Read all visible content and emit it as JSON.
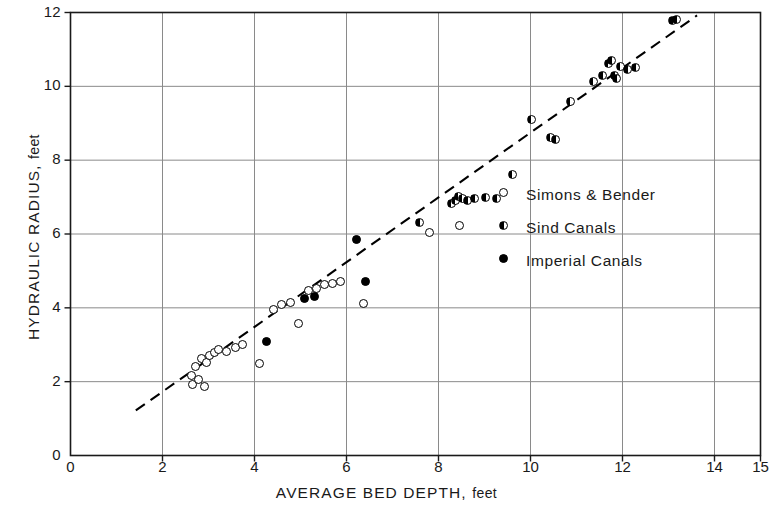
{
  "chart_data": {
    "type": "scatter",
    "title": "",
    "xlabel": "AVERAGE BED DEPTH, feet",
    "ylabel": "HYDRAULIC RADIUS, feet",
    "xlabel_main": "AVERAGE BED DEPTH,",
    "xlabel_units": "feet",
    "ylabel_main": "HYDRAULIC RADIUS,",
    "ylabel_units": "feet",
    "xlim": [
      0,
      15
    ],
    "ylim": [
      0,
      12
    ],
    "xticks": [
      0,
      2,
      4,
      6,
      8,
      10,
      12,
      14,
      15
    ],
    "yticks": [
      0,
      2,
      4,
      6,
      8,
      10,
      12
    ],
    "xtick_labels": [
      "0",
      "2",
      "4",
      "6",
      "8",
      "10",
      "12",
      "14",
      "15"
    ],
    "ytick_labels": [
      "0",
      "2",
      "4",
      "6",
      "8",
      "10",
      "12"
    ],
    "grid": true,
    "grid_x": [
      2,
      4,
      6,
      8,
      10,
      12,
      14
    ],
    "grid_y": [
      2,
      4,
      6,
      8,
      10
    ],
    "legend_position": "center-right",
    "axis_color": "#1a1a1a",
    "grid_color": "#8a8a8a",
    "marker_color": "#000000",
    "trendline": {
      "style": "dashed",
      "x0": 1.42,
      "y0": 1.22,
      "x1": 13.62,
      "y1": 11.92
    },
    "series": [
      {
        "name": "Simons & Bender",
        "marker": "open-circle",
        "points": [
          [
            2.62,
            2.18
          ],
          [
            2.66,
            1.92
          ],
          [
            2.72,
            2.4
          ],
          [
            2.78,
            2.05
          ],
          [
            2.84,
            2.62
          ],
          [
            2.92,
            1.88
          ],
          [
            2.96,
            2.52
          ],
          [
            3.02,
            2.7
          ],
          [
            3.12,
            2.78
          ],
          [
            3.22,
            2.86
          ],
          [
            3.4,
            2.82
          ],
          [
            3.58,
            2.92
          ],
          [
            3.74,
            3.0
          ],
          [
            4.1,
            2.5
          ],
          [
            4.42,
            3.95
          ],
          [
            4.58,
            4.08
          ],
          [
            4.78,
            4.14
          ],
          [
            4.96,
            3.58
          ],
          [
            5.18,
            4.46
          ],
          [
            5.34,
            4.52
          ],
          [
            5.52,
            4.62
          ],
          [
            5.7,
            4.66
          ],
          [
            5.86,
            4.7
          ],
          [
            6.38,
            4.12
          ],
          [
            7.8,
            6.05
          ],
          [
            8.46,
            6.22
          ]
        ]
      },
      {
        "name": "Sind Canals",
        "marker": "half-filled-circle",
        "points": [
          [
            7.58,
            6.32
          ],
          [
            8.28,
            6.82
          ],
          [
            8.36,
            6.9
          ],
          [
            8.44,
            7.02
          ],
          [
            8.52,
            6.96
          ],
          [
            8.62,
            6.92
          ],
          [
            8.78,
            6.96
          ],
          [
            9.02,
            6.98
          ],
          [
            9.26,
            6.96
          ],
          [
            9.6,
            7.62
          ],
          [
            10.02,
            9.1
          ],
          [
            10.44,
            8.62
          ],
          [
            10.54,
            8.56
          ],
          [
            10.86,
            9.58
          ],
          [
            11.36,
            10.14
          ],
          [
            11.56,
            10.28
          ],
          [
            11.7,
            10.62
          ],
          [
            11.76,
            10.7
          ],
          [
            11.82,
            10.28
          ],
          [
            11.88,
            10.22
          ],
          [
            11.96,
            10.54
          ],
          [
            12.1,
            10.46
          ],
          [
            12.28,
            10.52
          ],
          [
            13.08,
            11.78
          ],
          [
            13.18,
            11.82
          ]
        ]
      },
      {
        "name": "Imperial Canals",
        "marker": "filled-circle",
        "points": [
          [
            4.26,
            3.1
          ],
          [
            5.08,
            4.26
          ],
          [
            5.3,
            4.32
          ],
          [
            6.22,
            5.84
          ],
          [
            6.42,
            4.7
          ]
        ]
      }
    ]
  }
}
